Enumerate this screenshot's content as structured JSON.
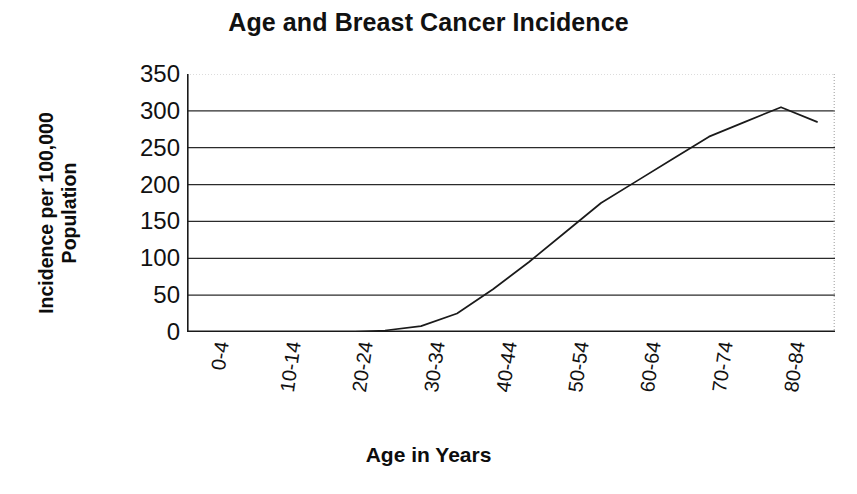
{
  "chart_data": {
    "type": "line",
    "title": "Age and Breast Cancer Incidence",
    "xlabel": "Age in Years",
    "ylabel": "Incidence per 100,000 Population",
    "ylabel_lines": [
      "Incidence per 100,000",
      "Population"
    ],
    "ylim": [
      0,
      350
    ],
    "ytick_step": 50,
    "ytick_labels": [
      "350",
      "300",
      "250",
      "200",
      "150",
      "100",
      "50",
      "0"
    ],
    "ytick_values": [
      350,
      300,
      250,
      200,
      150,
      100,
      50,
      0
    ],
    "grid": "horizontal",
    "grid_note": "Solid horizontal gridlines at every 50 units; topmost line at 350 is faint/dotted",
    "legend": "none",
    "line_color": "#1a1a1a",
    "line_width_px": 1.6,
    "markers": "none",
    "categories": [
      "0-4",
      "5-9",
      "10-14",
      "15-19",
      "20-24",
      "25-29",
      "30-34",
      "35-39",
      "40-44",
      "45-49",
      "50-54",
      "55-59",
      "60-64",
      "65-69",
      "70-74",
      "75-79",
      "80-84",
      "85+"
    ],
    "xtick_labels_shown": [
      "0-4",
      "10-14",
      "20-24",
      "30-34",
      "40-44",
      "50-54",
      "60-64",
      "70-74",
      "80-84"
    ],
    "xtick_label_rotation_deg": 82,
    "values": [
      0,
      0,
      0,
      0,
      0,
      2,
      8,
      25,
      58,
      95,
      135,
      175,
      205,
      235,
      265,
      285,
      305,
      285
    ],
    "series": [
      {
        "name": "Breast cancer incidence",
        "values": [
          0,
          0,
          0,
          0,
          0,
          2,
          8,
          25,
          58,
          95,
          135,
          175,
          205,
          235,
          265,
          285,
          305,
          285
        ]
      }
    ],
    "peak": {
      "category": "80-84",
      "value": 305
    },
    "final": {
      "category": "85+",
      "value": 285
    }
  },
  "colors": {
    "background": "#ffffff",
    "foreground": "#111111",
    "gridline": "#2b2b2b",
    "gridline_faint": "#b9b9b9",
    "axis": "#1a1a1a",
    "series": "#1a1a1a"
  }
}
